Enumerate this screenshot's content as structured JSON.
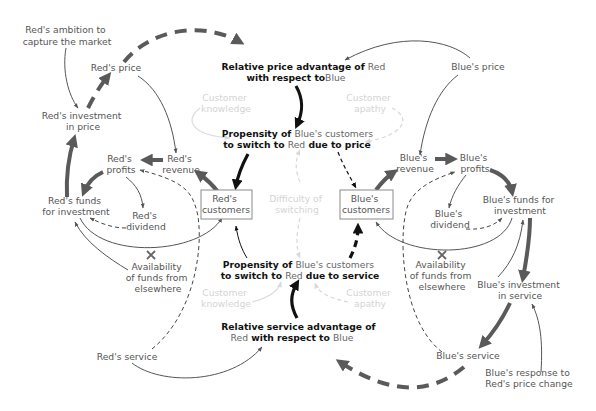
{
  "diagram": {
    "title": "",
    "colors": {
      "red_node_text": "#555555",
      "blue_node_text": "#555555",
      "central_text": "#111111",
      "faint_text": "#d4d4d4",
      "thick_link": "#5a5a5a",
      "bold_link": "#111111"
    },
    "nodes": {
      "red_ambition": [
        "Red's ambition to",
        "capture the market"
      ],
      "red_price": [
        "Red's price"
      ],
      "red_investment_price": [
        "Red's investment",
        "in price"
      ],
      "red_profits": [
        "Red's",
        "profits"
      ],
      "red_revenue": [
        "Red's",
        "revenue"
      ],
      "red_funds": [
        "Red's funds",
        "for investment"
      ],
      "red_dividend": [
        "Red's",
        "dividend"
      ],
      "red_customers": [
        "Red's",
        "customers"
      ],
      "red_availability": [
        "Availability",
        "of funds from",
        "elsewhere"
      ],
      "red_service": [
        "Red's service"
      ],
      "blue_price": [
        "Blue's price"
      ],
      "blue_revenue": [
        "Blue's",
        "revenue"
      ],
      "blue_profits": [
        "Blue's",
        "profits"
      ],
      "blue_funds": [
        "Blue's funds for",
        "investment"
      ],
      "blue_dividend": [
        "Blue's",
        "dividend"
      ],
      "blue_customers": [
        "Blue's",
        "customers"
      ],
      "blue_availability": [
        "Availability",
        "of funds from",
        "elsewhere"
      ],
      "blue_investment_service": [
        "Blue's investment",
        "in service"
      ],
      "blue_service": [
        "Blue's service"
      ],
      "blue_response": [
        "Blue's response to",
        "Red's price change"
      ],
      "price_advantage": {
        "line1_a": "Relative price advantage of ",
        "line1_b": "Red",
        "line2_a": "with respect to",
        "line2_b": "Blue"
      },
      "propensity_price": {
        "line1_a": "Propensity of ",
        "line1_b": "Blue's customers",
        "line2_a": "to switch to ",
        "line2_b": "Red",
        "line2_c": " due to price"
      },
      "propensity_service": {
        "line1_a": "Propensity of ",
        "line1_b": "Blue's customers",
        "line2_a": "to switch to ",
        "line2_b": "Red",
        "line2_c": " due to service"
      },
      "service_advantage": {
        "line1": "Relative service advantage of",
        "line2_a": "Red",
        "line2_b": " with respect to ",
        "line2_c": "Blue"
      },
      "customer_knowledge_top": [
        "Customer",
        "knowledge"
      ],
      "customer_apathy_top": [
        "Customer",
        "apathy"
      ],
      "difficulty_switching": [
        "Difficulty of",
        "switching"
      ],
      "customer_knowledge_bottom": [
        "Customer",
        "knowledge"
      ],
      "customer_apathy_bottom": [
        "Customer",
        "apathy"
      ]
    }
  }
}
